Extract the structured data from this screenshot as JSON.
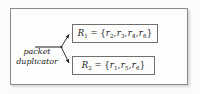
{
  "figure": {
    "title_label": "packet duplicator diagram",
    "duplicator": {
      "line1": "packet",
      "line2": "duplicator"
    },
    "outputs": [
      {
        "name": "R",
        "name_subscript": "1",
        "operator": "=",
        "open_brace": "{",
        "close_brace": "}",
        "separator": ",",
        "elements": [
          {
            "symbol": "r",
            "subscript": "2"
          },
          {
            "symbol": "r",
            "subscript": "3"
          },
          {
            "symbol": "r",
            "subscript": "4"
          },
          {
            "symbol": "r",
            "subscript": "6"
          }
        ],
        "full_text": "R1 = {r2, r3, r4, r6}"
      },
      {
        "name": "R",
        "name_subscript": "2",
        "operator": "=",
        "open_brace": "{",
        "close_brace": "}",
        "separator": ",",
        "elements": [
          {
            "symbol": "r",
            "subscript": "1"
          },
          {
            "symbol": "r",
            "subscript": "5"
          },
          {
            "symbol": "r",
            "subscript": "6"
          }
        ],
        "full_text": "R2 = {r1, r5, r6}"
      }
    ],
    "colors": {
      "background": "#fbfbfa",
      "frame_border": "#8a8a8a",
      "box_border": "#6f6f6f",
      "stroke": "#1a1a1a",
      "text": "#1a1a1a"
    }
  }
}
